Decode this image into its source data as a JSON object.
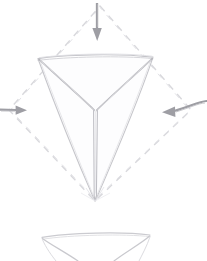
{
  "canvas": {
    "width": 207,
    "height": 261,
    "background_color": "#ffffff",
    "style_description": "pencil-sketch line drawing",
    "title": "inverted-cone-compression-sketch"
  },
  "palette": {
    "sketch_line": "#c9c9cd",
    "sketch_line_dark": "#a9a9b0",
    "sketch_line_faint": "#dedee2",
    "dashed_guide": "#d8d8dc",
    "arrow_fill": "#9e9ea4",
    "arrow_stroke": "#9e9ea4"
  },
  "shapes": {
    "dashed_diamond": {
      "name": "dashed-diamond-guide",
      "stroke": "#d8d8dc",
      "dash_pattern": "7 6",
      "stroke_width": 1.3,
      "vertices": [
        {
          "label": "top",
          "x": 100,
          "y": 6
        },
        {
          "label": "right",
          "x": 191,
          "y": 110
        },
        {
          "label": "bottom",
          "x": 95,
          "y": 201
        },
        {
          "label": "left",
          "x": 9,
          "y": 110
        }
      ]
    },
    "main_cone": {
      "name": "inverted-triangular-cone",
      "stroke": "#c2c2c7",
      "stroke_width": 1.1,
      "top_edge": {
        "x1": 38,
        "y1": 58,
        "x2": 153,
        "y2": 57
      },
      "apex": {
        "x": 95,
        "y": 201
      },
      "inner_junction": {
        "x": 96,
        "y": 110
      },
      "left_corner": {
        "x": 38,
        "y": 58
      },
      "right_corner": {
        "x": 153,
        "y": 57
      },
      "spine": {
        "x1": 94,
        "y1": 110,
        "x2": 95,
        "y2": 201,
        "width": 4
      }
    },
    "bottom_partial_cone": {
      "name": "bottom-partial-cone",
      "stroke": "#cfcfd4",
      "stroke_width": 1.1,
      "top_edge": {
        "x1": 42,
        "y1": 236,
        "x2": 150,
        "y2": 234
      },
      "visible_to_y": 261
    }
  },
  "arrows": [
    {
      "id": "arrow-top",
      "name": "arrow-top-inward",
      "direction": "down",
      "label": "",
      "color": "#9e9ea4",
      "tail": {
        "x": 97,
        "y": 3
      },
      "head": {
        "x": 97,
        "y": 40
      },
      "shaft_width": 2.2,
      "head_length": 13,
      "head_width": 9
    },
    {
      "id": "arrow-left",
      "name": "arrow-left-inward",
      "direction": "right",
      "label": "",
      "color": "#9e9ea4",
      "tail": {
        "x": 0,
        "y": 110
      },
      "head": {
        "x": 26,
        "y": 110
      },
      "shaft_width": 2.2,
      "head_length": 11,
      "head_width": 9
    },
    {
      "id": "arrow-right",
      "name": "arrow-right-inward",
      "direction": "left",
      "label": "",
      "color": "#9e9ea4",
      "tail": {
        "x": 207,
        "y": 105
      },
      "head": {
        "x": 162,
        "y": 112
      },
      "shaft_width": 2.2,
      "head_length": 12,
      "head_width": 10
    }
  ],
  "annotations": {
    "text_labels": [],
    "note": ""
  }
}
